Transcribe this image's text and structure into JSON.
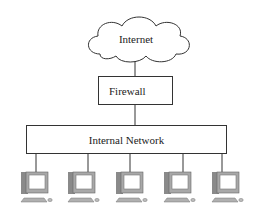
{
  "diagram": {
    "type": "network-topology",
    "nodes": {
      "internet": {
        "label": "Internet",
        "shape": "cloud"
      },
      "firewall": {
        "label": "Firewall",
        "shape": "rectangle"
      },
      "internal_network": {
        "label": "Internal Network",
        "shape": "rectangle"
      },
      "computers": [
        {
          "label": "",
          "icon": "desktop-computer-icon"
        },
        {
          "label": "",
          "icon": "desktop-computer-icon"
        },
        {
          "label": "",
          "icon": "desktop-computer-icon"
        },
        {
          "label": "",
          "icon": "desktop-computer-icon"
        },
        {
          "label": "",
          "icon": "desktop-computer-icon"
        }
      ]
    },
    "edges": [
      [
        "internet",
        "firewall"
      ],
      [
        "firewall",
        "internal_network"
      ],
      [
        "internal_network",
        "computer-1"
      ],
      [
        "internal_network",
        "computer-2"
      ],
      [
        "internal_network",
        "computer-3"
      ],
      [
        "internal_network",
        "computer-4"
      ],
      [
        "internal_network",
        "computer-5"
      ]
    ],
    "colors": {
      "stroke": "#333333",
      "background": "#ffffff",
      "monitor_body": "#9a9a9a",
      "screen": "#ffffff"
    }
  }
}
